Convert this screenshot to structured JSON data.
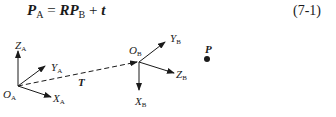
{
  "equation": {
    "lhs_symbol": "P",
    "lhs_sub": "A",
    "equals": " = ",
    "rhs_R": "R",
    "rhs_P": "P",
    "rhs_sub": "B",
    "plus": " + ",
    "rhs_t": "t",
    "number": "(7-1)"
  },
  "frame_a": {
    "origin": {
      "label": "O",
      "sub": "A"
    },
    "z_axis": {
      "label": "Z",
      "sub": "A"
    },
    "y_axis": {
      "label": "Y",
      "sub": "A"
    },
    "x_axis": {
      "label": "X",
      "sub": "A"
    }
  },
  "frame_b": {
    "origin": {
      "label": "O",
      "sub": "B"
    },
    "y_axis": {
      "label": "Y",
      "sub": "B"
    },
    "z_axis": {
      "label": "Z",
      "sub": "B"
    },
    "x_axis": {
      "label": "X",
      "sub": "B"
    }
  },
  "translation": {
    "label": "T"
  },
  "point": {
    "label": "P"
  },
  "colors": {
    "ink": "#1a1a1a",
    "background": "#ffffff"
  }
}
